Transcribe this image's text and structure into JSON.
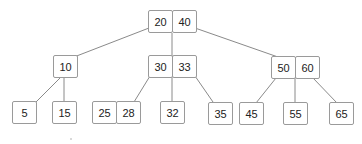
{
  "diagram": {
    "type": "b-tree",
    "edge_color": "#8a8a8a",
    "border_color": "#9a9a9a",
    "nodes": {
      "root": {
        "keys": [
          "20",
          "40"
        ]
      },
      "left": {
        "keys": [
          "10"
        ]
      },
      "middle": {
        "keys": [
          "30",
          "33"
        ]
      },
      "right": {
        "keys": [
          "50",
          "60"
        ]
      },
      "leaf_5": {
        "keys": [
          "5"
        ]
      },
      "leaf_15": {
        "keys": [
          "15"
        ]
      },
      "leaf_25_28": {
        "keys": [
          "25",
          "28"
        ]
      },
      "leaf_32": {
        "keys": [
          "32"
        ]
      },
      "leaf_35": {
        "keys": [
          "35"
        ]
      },
      "leaf_45": {
        "keys": [
          "45"
        ]
      },
      "leaf_55": {
        "keys": [
          "55"
        ]
      },
      "leaf_65": {
        "keys": [
          "65"
        ]
      }
    },
    "edges": [
      [
        "root",
        "left"
      ],
      [
        "root",
        "middle"
      ],
      [
        "root",
        "right"
      ],
      [
        "left",
        "leaf_5"
      ],
      [
        "left",
        "leaf_15"
      ],
      [
        "middle",
        "leaf_25_28"
      ],
      [
        "middle",
        "leaf_32"
      ],
      [
        "middle",
        "leaf_35"
      ],
      [
        "right",
        "leaf_45"
      ],
      [
        "right",
        "leaf_55"
      ],
      [
        "right",
        "leaf_65"
      ]
    ]
  }
}
